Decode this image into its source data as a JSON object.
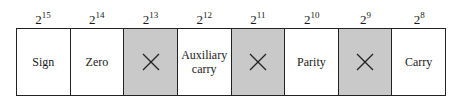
{
  "diagram": {
    "bits": [
      {
        "base": "2",
        "exp": "15",
        "label": "Sign",
        "unused": false
      },
      {
        "base": "2",
        "exp": "14",
        "label": "Zero",
        "unused": false
      },
      {
        "base": "2",
        "exp": "13",
        "label": "",
        "unused": true,
        "mark": "X"
      },
      {
        "base": "2",
        "exp": "12",
        "label": "Auxiliary carry",
        "label_line1": "Auxiliary",
        "label_line2": "carry",
        "unused": false
      },
      {
        "base": "2",
        "exp": "11",
        "label": "",
        "unused": true,
        "mark": "X"
      },
      {
        "base": "2",
        "exp": "10",
        "label": "Parity",
        "unused": false
      },
      {
        "base": "2",
        "exp": "9",
        "label": "",
        "unused": true,
        "mark": "X"
      },
      {
        "base": "2",
        "exp": "8",
        "label": "Carry",
        "unused": false
      }
    ],
    "colors": {
      "unused_fill": "#c9c9c9",
      "border": "#222222",
      "cell_fill": "#ffffff"
    }
  }
}
